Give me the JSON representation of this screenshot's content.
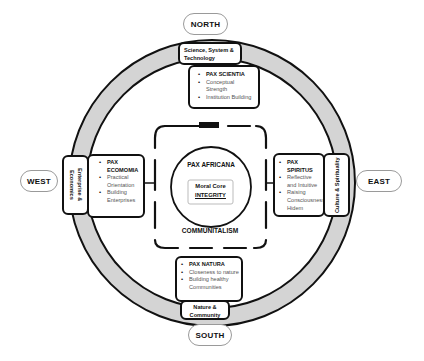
{
  "directions": {
    "north": "NORTH",
    "south": "SOUTH",
    "east": "EAST",
    "west": "WEST"
  },
  "north": {
    "label": "Science, System & Technology",
    "items": [
      {
        "text": "PAX SCIENTIA",
        "title": true
      },
      {
        "text": "Conceptual Strength",
        "title": false
      },
      {
        "text": "Institution Building",
        "title": false
      }
    ]
  },
  "west": {
    "label": "Enterprise & Economics",
    "items": [
      {
        "text": "PAX ECOMOMIA",
        "title": true
      },
      {
        "text": "Practical Orientation",
        "title": false
      },
      {
        "text": "Building Enterprises",
        "title": false
      }
    ]
  },
  "east": {
    "label": "Culture & Spirituality",
    "items": [
      {
        "text": "PAX SPIRITUS",
        "title": true
      },
      {
        "text": "Reflective and Intuitive",
        "title": false
      },
      {
        "text": "Raising Consciousness, Hidem",
        "title": false
      }
    ]
  },
  "south": {
    "label": "Nature & Community",
    "items": [
      {
        "text": "PAX NATURA",
        "title": true
      },
      {
        "text": "Closeness to nature",
        "title": false
      },
      {
        "text": "Building healthy Communities",
        "title": false
      }
    ]
  },
  "center": {
    "outer_label": "PAX AFRICANA",
    "core_line1": "Moral Core",
    "core_line2": "INTEGRITY",
    "bottom_label": "COMMUNITALISM"
  },
  "colors": {
    "ring_fill": "#d4d4d4",
    "stroke": "#111111",
    "muted_text": "#555555"
  }
}
